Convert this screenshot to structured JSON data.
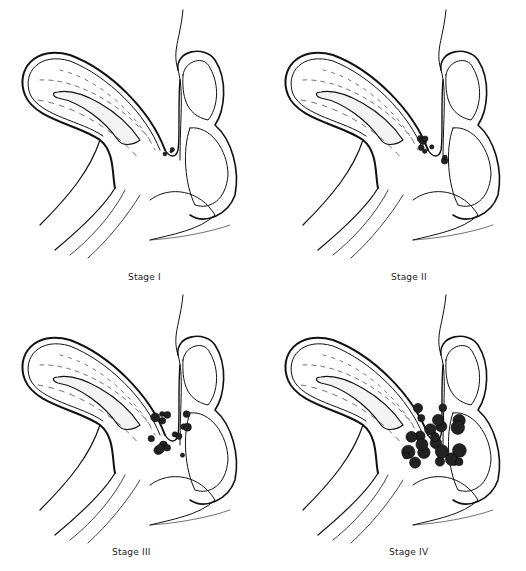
{
  "figure": {
    "panels": [
      {
        "label": "Stage I",
        "lesion_count": 3,
        "lesion_size": 2
      },
      {
        "label": "Stage II",
        "lesion_count": 8,
        "lesion_size": 3
      },
      {
        "label": "Stage III",
        "lesion_count": 16,
        "lesion_size": 4
      },
      {
        "label": "Stage IV",
        "lesion_count": 24,
        "lesion_size": 6
      }
    ]
  }
}
